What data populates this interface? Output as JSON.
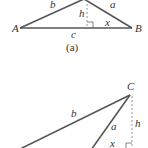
{
  "figure_a": {
    "caption": "(a)",
    "vertices": {
      "A": "A",
      "B": "B"
    },
    "sides": {
      "a": "a",
      "b": "b",
      "c": "c"
    },
    "height_label": "h",
    "segment_label": "x"
  },
  "figure_b": {
    "vertices": {
      "C": "C"
    },
    "sides": {
      "a": "a",
      "b": "b"
    },
    "height_label": "h",
    "segment_label": "x"
  },
  "colors": {
    "line": "#555555",
    "dashed": "#888888",
    "text": "#333333",
    "background": "#ffffff"
  }
}
